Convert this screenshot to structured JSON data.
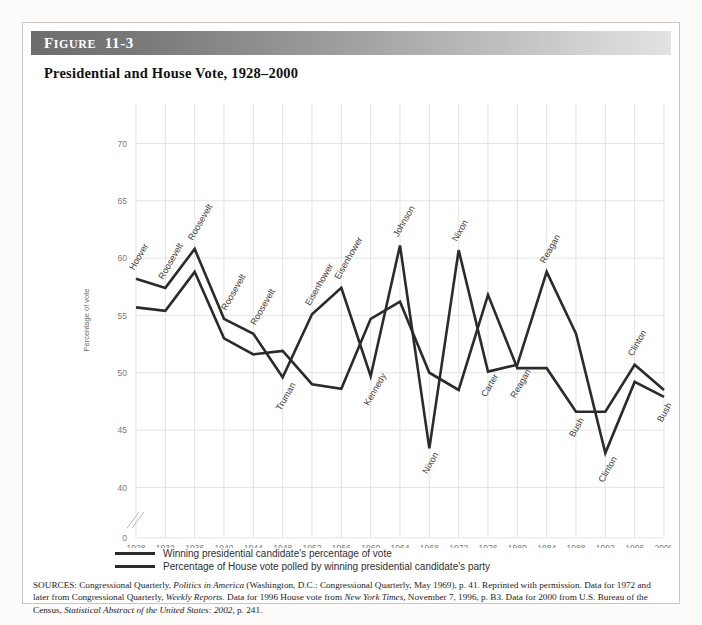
{
  "figure": {
    "label_first": "F",
    "label_rest": "IGURE",
    "number": "11-3",
    "title": "Presidential and House Vote, 1928–2000"
  },
  "legend": {
    "items": [
      {
        "label": "Winning presidential candidate's percentage of vote",
        "color": "#2b2b2b"
      },
      {
        "label": "Percentage of House vote polled by winning presidential candidate's party",
        "color": "#2b2b2b"
      }
    ]
  },
  "sources": {
    "line1_a": "SOURCES: Congressional Quarterly, ",
    "line1_i": "Politics in America",
    "line1_b": " (Washington, D.C.: Congressional Quarterly, May 1969), p. 41. Reprinted with permission. Data for 1972 and later from Congressional Quarterly, ",
    "line2_i": "Weekly Reports.",
    "line2_b": " Data for 1996 House vote from ",
    "line2_i2": "New York Times,",
    "line2_c": " November 7, 1996, p. B3. Data for 2000 from U.S. Bureau of the Census, ",
    "line3_i": "Statistical Abstract of the United States: 2002,",
    "line3_b": " p. 241."
  },
  "chart_data": {
    "type": "line",
    "title": "Presidential and House Vote, 1928–2000",
    "xlabel": "",
    "ylabel": "Percentage of vote",
    "ylim": [
      38,
      71
    ],
    "yticks": [
      40,
      45,
      50,
      55,
      60,
      65,
      70
    ],
    "y_axis_break": true,
    "y_break_tick": "0",
    "grid": true,
    "legend_position": "below-plot",
    "categories": [
      1928,
      1932,
      1936,
      1940,
      1944,
      1948,
      1952,
      1956,
      1960,
      1964,
      1968,
      1972,
      1976,
      1980,
      1984,
      1988,
      1992,
      1996,
      2000
    ],
    "xtick_labels": [
      "1928",
      "1932",
      "1936",
      "1940",
      "1944",
      "1948",
      "1952",
      "1956",
      "1960",
      "1964",
      "1968",
      "1972",
      "1976",
      "1980",
      "1984",
      "1988",
      "1992",
      "1996",
      "2000"
    ],
    "series": [
      {
        "name": "Winning presidential candidate's percentage of vote",
        "color": "#2b2b2b",
        "values": [
          58.2,
          57.4,
          60.8,
          54.7,
          53.4,
          49.6,
          55.1,
          57.4,
          49.7,
          61.1,
          43.4,
          60.7,
          50.1,
          50.7,
          58.8,
          53.4,
          43.0,
          49.2,
          47.9
        ]
      },
      {
        "name": "Percentage of House vote polled by winning presidential candidate's party",
        "color": "#2b2b2b",
        "values": [
          55.7,
          55.4,
          58.8,
          53.0,
          51.6,
          51.9,
          49.0,
          48.6,
          54.7,
          56.2,
          50.0,
          48.5,
          56.8,
          50.4,
          50.4,
          46.6,
          46.6,
          50.7,
          48.5
        ]
      }
    ],
    "annotations": [
      {
        "text": "Hoover",
        "year": 1928,
        "value": 58.2,
        "series": 0,
        "dx": -2,
        "dy": -8
      },
      {
        "text": "Roosevelt",
        "year": 1932,
        "value": 57.4,
        "series": 0,
        "dx": -2,
        "dy": -8
      },
      {
        "text": "Roosevelt",
        "year": 1936,
        "value": 60.8,
        "series": 0,
        "dx": -2,
        "dy": -8
      },
      {
        "text": "Roosevelt",
        "year": 1940,
        "value": 54.7,
        "series": 0,
        "dx": 2,
        "dy": -8
      },
      {
        "text": "Roosevelt",
        "year": 1944,
        "value": 53.4,
        "series": 0,
        "dx": 2,
        "dy": -8
      },
      {
        "text": "Truman",
        "year": 1948,
        "value": 49.6,
        "series": 0,
        "dx": -2,
        "dy": 34
      },
      {
        "text": "Eisenhower",
        "year": 1952,
        "value": 55.1,
        "series": 0,
        "dx": -2,
        "dy": -8
      },
      {
        "text": "Eisenhower",
        "year": 1956,
        "value": 57.4,
        "series": 0,
        "dx": -2,
        "dy": -8
      },
      {
        "text": "Kennedy",
        "year": 1960,
        "value": 49.7,
        "series": 0,
        "dx": -2,
        "dy": 30
      },
      {
        "text": "Johnson",
        "year": 1964,
        "value": 61.1,
        "series": 0,
        "dx": -2,
        "dy": -8
      },
      {
        "text": "Nixon",
        "year": 1968,
        "value": 43.4,
        "series": 0,
        "dx": -2,
        "dy": 26
      },
      {
        "text": "Nixon",
        "year": 1972,
        "value": 60.7,
        "series": 0,
        "dx": -2,
        "dy": -8
      },
      {
        "text": "Carter",
        "year": 1976,
        "value": 50.1,
        "series": 0,
        "dx": -2,
        "dy": 26
      },
      {
        "text": "Reagan",
        "year": 1980,
        "value": 50.7,
        "series": 0,
        "dx": -2,
        "dy": 34
      },
      {
        "text": "Reagan",
        "year": 1984,
        "value": 58.8,
        "series": 0,
        "dx": -2,
        "dy": -8
      },
      {
        "text": "Bush",
        "year": 1988,
        "value": 46.6,
        "series": 1,
        "dx": -2,
        "dy": 26
      },
      {
        "text": "Clinton",
        "year": 1992,
        "value": 43.0,
        "series": 0,
        "dx": -2,
        "dy": 30
      },
      {
        "text": "Clinton",
        "year": 1996,
        "value": 50.7,
        "series": 1,
        "dx": -2,
        "dy": -8
      },
      {
        "text": "Bush",
        "year": 2000,
        "value": 47.9,
        "series": 0,
        "dx": -2,
        "dy": 26
      }
    ]
  }
}
